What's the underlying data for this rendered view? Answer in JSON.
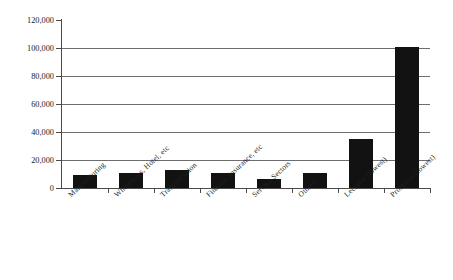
{
  "chart_data": {
    "type": "bar",
    "title": "",
    "subtitle": "",
    "xlabel": "",
    "ylabel": "",
    "ylim": [
      0,
      120000
    ],
    "ytick_values": [
      0,
      20000,
      40000,
      60000,
      80000,
      100000,
      120000
    ],
    "ytick_labels": [
      "0",
      "20,000",
      "40,000",
      "60,000",
      "80,000",
      "100,000",
      "120,000"
    ],
    "grid": true,
    "grid_axis": "y",
    "legend": false,
    "legend_position": "none",
    "bar_color": "#121212",
    "categories": [
      "Manufacturing",
      "Wholesales, Hotel, etc",
      "Transportation",
      "Finance, Insurance, etc",
      "Service Sectors",
      "Others",
      "Lecturer (lowest)",
      "Professor (lowest)"
    ],
    "values": [
      9300,
      11000,
      13000,
      11000,
      6500,
      10500,
      35000,
      101000
    ],
    "annotations": []
  },
  "axes": {
    "y_axis_name": "y-axis",
    "x_axis_name": "x-axis"
  }
}
